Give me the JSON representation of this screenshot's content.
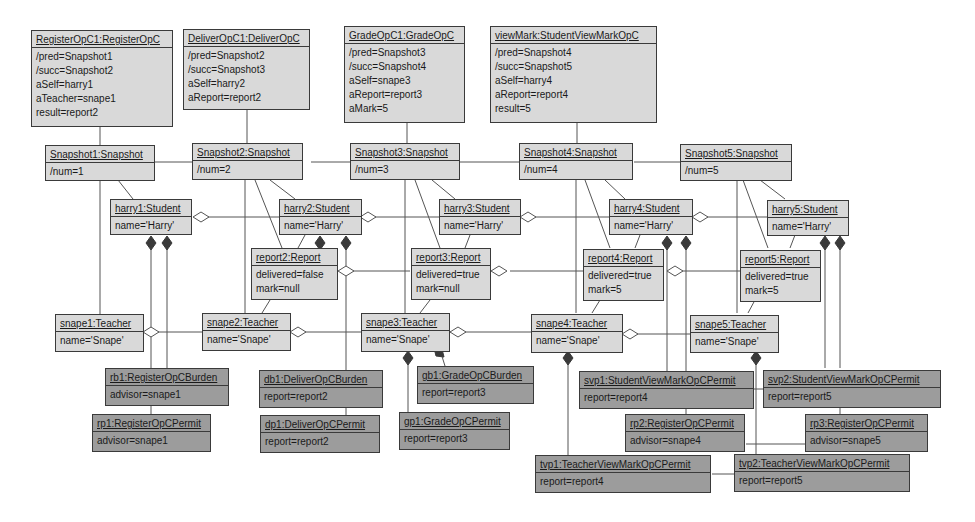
{
  "diagram": {
    "type": "UML object diagram",
    "operations": [
      {
        "id": "op1",
        "title": "RegisterOpC1:RegisterOpC",
        "attrs": [
          "/pred=Snapshot1",
          "/succ=Snapshot2",
          "aSelf=harry1",
          "aTeacher=snape1",
          "result=report2"
        ]
      },
      {
        "id": "op2",
        "title": "DeliverOpC1:DeliverOpC",
        "attrs": [
          "/pred=Snapshot2",
          "/succ=Snapshot3",
          "aSelf=harry2",
          "aReport=report2"
        ]
      },
      {
        "id": "op3",
        "title": "GradeOpC1:GradeOpC",
        "attrs": [
          "/pred=Snapshot3",
          "/succ=Snapshot4",
          "aSelf=snape3",
          "aReport=report3",
          "aMark=5"
        ]
      },
      {
        "id": "op4",
        "title": "viewMark:StudentViewMarkOpC",
        "attrs": [
          "/pred=Snapshot4",
          "/succ=Snapshot5",
          "aSelf=harry4",
          "aReport=report4",
          "result=5"
        ]
      }
    ],
    "snapshots": [
      {
        "title": "Snapshot1:Snapshot",
        "attrs": [
          "/num=1"
        ]
      },
      {
        "title": "Snapshot2:Snapshot",
        "attrs": [
          "/num=2"
        ]
      },
      {
        "title": "Snapshot3:Snapshot",
        "attrs": [
          "/num=3"
        ]
      },
      {
        "title": "Snapshot4:Snapshot",
        "attrs": [
          "/num=4"
        ]
      },
      {
        "title": "Snapshot5:Snapshot",
        "attrs": [
          "/num=5"
        ]
      }
    ],
    "students": [
      {
        "title": "harry1:Student",
        "attrs": [
          "name='Harry'"
        ]
      },
      {
        "title": "harry2:Student",
        "attrs": [
          "name='Harry'"
        ]
      },
      {
        "title": "harry3:Student",
        "attrs": [
          "name='Harry'"
        ]
      },
      {
        "title": "harry4:Student",
        "attrs": [
          "name='Harry'"
        ]
      },
      {
        "title": "harry5:Student",
        "attrs": [
          "name='Harry'"
        ]
      }
    ],
    "reports": [
      {
        "title": "report2:Report",
        "attrs": [
          "delivered=false",
          "mark=null"
        ]
      },
      {
        "title": "report3:Report",
        "attrs": [
          "delivered=true",
          "mark=null"
        ]
      },
      {
        "title": "report4:Report",
        "attrs": [
          "delivered=true",
          "mark=5"
        ]
      },
      {
        "title": "report5:Report",
        "attrs": [
          "delivered=true",
          "mark=5"
        ]
      }
    ],
    "teachers": [
      {
        "title": "snape1:Teacher",
        "attrs": [
          "name='Snape'"
        ]
      },
      {
        "title": "snape2:Teacher",
        "attrs": [
          "name='Snape'"
        ]
      },
      {
        "title": "snape3:Teacher",
        "attrs": [
          "name='Snape'"
        ]
      },
      {
        "title": "snape4:Teacher",
        "attrs": [
          "name='Snape'"
        ]
      },
      {
        "title": "snape5:Teacher",
        "attrs": [
          "name='Snape'"
        ]
      }
    ],
    "permits": [
      {
        "title": "rb1:RegisterOpCBurden",
        "attrs": [
          "advisor=snape1"
        ]
      },
      {
        "title": "rp1:RegisterOpCPermit",
        "attrs": [
          "advisor=snape1"
        ]
      },
      {
        "title": "db1:DeliverOpCBurden",
        "attrs": [
          "report=report2"
        ]
      },
      {
        "title": "dp1:DeliverOpCPermit",
        "attrs": [
          "report=report2"
        ]
      },
      {
        "title": "gb1:GradeOpCBurden",
        "attrs": [
          "report=report3"
        ]
      },
      {
        "title": "gp1:GradeOpCPermit",
        "attrs": [
          "report=report3"
        ]
      },
      {
        "title": "svp1:StudentViewMarkOpCPermit",
        "attrs": [
          "report=report4"
        ]
      },
      {
        "title": "svp2:StudentViewMarkOpCPermit",
        "attrs": [
          "report=report5"
        ]
      },
      {
        "title": "rp2:RegisterOpCPermit",
        "attrs": [
          "advisor=snape4"
        ]
      },
      {
        "title": "rp3:RegisterOpCPermit",
        "attrs": [
          "advisor=snape5"
        ]
      },
      {
        "title": "tvp1:TeacherViewMarkOpCPermit",
        "attrs": [
          "report=report4"
        ]
      },
      {
        "title": "tvp2:TeacherViewMarkOpCPermit",
        "attrs": [
          "report=report5"
        ]
      }
    ],
    "colors": {
      "object_fill": "#d9d9d9",
      "permit_fill": "#9c9c9c",
      "border": "#3a3a3a",
      "line": "#555555"
    }
  }
}
